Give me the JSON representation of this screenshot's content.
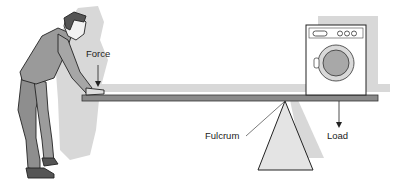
{
  "diagram": {
    "labels": {
      "force": "Force",
      "fulcrum": "Fulcrum",
      "load": "Load"
    },
    "figures": [
      "person-pushing",
      "plank-lever",
      "washing-machine",
      "fulcrum-triangle"
    ],
    "colors": {
      "shadow": "#d6d6d6",
      "plank": "#8a8a8a",
      "clothing": "#9a9a9a",
      "outline": "#222222",
      "fulcrum_fill": "#e4e4e4"
    }
  }
}
